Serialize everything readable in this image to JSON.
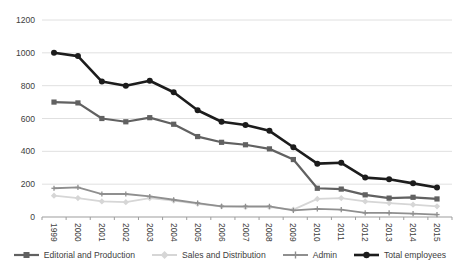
{
  "chart_data": {
    "type": "line",
    "title": "",
    "xlabel": "",
    "ylabel": "",
    "x_categories": [
      "1999",
      "2000",
      "2001",
      "2002",
      "2003",
      "2004",
      "2005",
      "2006",
      "2007",
      "2008",
      "2009",
      "2010",
      "2011",
      "2012",
      "2013",
      "2014",
      "2015"
    ],
    "series": [
      {
        "name": "Editorial and Production",
        "color": "#616161",
        "marker": "square",
        "line_width": 2.2,
        "values": [
          700,
          695,
          600,
          580,
          605,
          565,
          490,
          455,
          440,
          415,
          350,
          175,
          170,
          135,
          115,
          120,
          110
        ]
      },
      {
        "name": "Sales and Distribution",
        "color": "#d6d6d6",
        "marker": "diamond",
        "line_width": 1.8,
        "values": [
          130,
          115,
          95,
          90,
          115,
          100,
          80,
          65,
          60,
          60,
          45,
          110,
          115,
          95,
          85,
          75,
          65
        ]
      },
      {
        "name": "Admin",
        "color": "#8f8f8f",
        "marker": "cross",
        "line_width": 1.8,
        "values": [
          175,
          180,
          140,
          140,
          125,
          105,
          85,
          65,
          65,
          65,
          40,
          50,
          45,
          25,
          25,
          20,
          15
        ]
      },
      {
        "name": "Total employees",
        "color": "#1c1c1c",
        "marker": "circle",
        "line_width": 2.6,
        "values": [
          1000,
          980,
          825,
          800,
          830,
          760,
          650,
          580,
          560,
          525,
          425,
          325,
          330,
          240,
          230,
          205,
          180
        ]
      }
    ],
    "ylim": [
      0,
      1200
    ],
    "yticks": [
      0,
      200,
      400,
      600,
      800,
      1000,
      1200
    ],
    "grid": true,
    "legend_position": "bottom",
    "style": {
      "grid_color": "#e0e0e0",
      "axis_color": "#9d9d9d",
      "tick_label_color": "#404040",
      "background": "#ffffff"
    }
  }
}
